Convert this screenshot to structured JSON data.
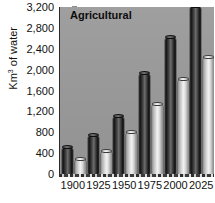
{
  "chart_data": {
    "type": "bar",
    "title": "Agricultural",
    "xlabel": "",
    "ylabel": "Km³ of water",
    "ylabel_base": "Km",
    "ylabel_sup": "3",
    "ylabel_tail": " of water",
    "categories": [
      "1900",
      "1925",
      "1950",
      "1975",
      "2000",
      "2025"
    ],
    "series": [
      {
        "name": "Water withdrawal",
        "values": [
          520,
          750,
          1120,
          1930,
          2630,
          3210
        ],
        "color": "#2b2b2b"
      },
      {
        "name": "Water consumption",
        "values": [
          290,
          450,
          810,
          1350,
          1830,
          2250
        ],
        "color": "#e6e6e6"
      }
    ],
    "ylim": [
      0,
      3200
    ],
    "yticks": [
      0,
      400,
      800,
      1200,
      1600,
      2000,
      2400,
      2800,
      3200
    ],
    "ytick_labels": [
      "0",
      "400",
      "800",
      "1,200",
      "1,600",
      "2,000",
      "2,400",
      "2,800",
      "3,200"
    ],
    "grid": false,
    "legend": "none",
    "plot_background": "#9a9a9a",
    "figure_background": "#ffffff"
  }
}
